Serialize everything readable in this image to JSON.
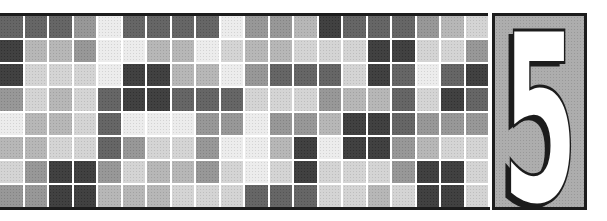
{
  "chapter": {
    "number": "5"
  },
  "banner": {
    "page_background": "#ffffff",
    "rule_color": "#1c1c1c",
    "tile_gap_color": "#ffffff",
    "panel": {
      "fill": "#a9a9a9",
      "border_color": "#1c1c1c",
      "numeral_color": "#ffffff",
      "numeral_outline_color": "#1c1c1c",
      "numeral_shadow_color": "#1c1c1c"
    },
    "mosaic": {
      "columns": 20,
      "rows": 8,
      "palette": {
        "W": "#ebebeb",
        "L": "#d2d2d2",
        "M": "#b3b3b3",
        "G": "#929292",
        "D": "#5e5e5e",
        "K": "#373737"
      },
      "grid": [
        "DDDGWDDDDWGGMKDDDGML",
        "KMMGWWMMWLMMLLLKKLLG",
        "KLLLWKKMMWGDDDLKDWDK",
        "GLMLDKKDDDLLLGMMDLKD",
        "WMMLDWWWGGWGGMKKDGGG",
        "MMLLDGLLGWWMKWKKGMLL",
        "LGKKGLMMGLWLKLLLGKKL",
        "GGKKMMMLLLDDDLLMLKKL"
      ]
    }
  }
}
